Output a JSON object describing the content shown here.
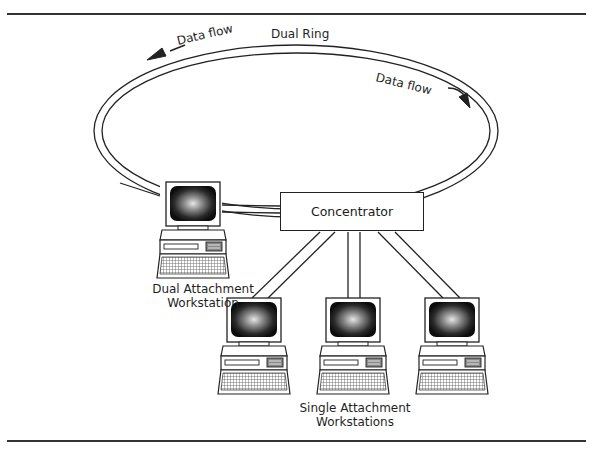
{
  "diagram": {
    "type": "network-topology",
    "ring": {
      "label": "Dual Ring",
      "flow_left_label": "Data flow",
      "flow_right_label": "Data flow"
    },
    "concentrator": {
      "label": "Concentrator"
    },
    "dual_attachment": {
      "label_line1": "Dual Attachment",
      "label_line2": "Workstation"
    },
    "single_attachment": {
      "label_line1": "Single Attachment",
      "label_line2": "Workstations",
      "count": 3
    },
    "colors": {
      "line": "#222222",
      "screen_dark": "#111111",
      "screen_glow": "#d8d8d8",
      "background": "#ffffff"
    }
  }
}
